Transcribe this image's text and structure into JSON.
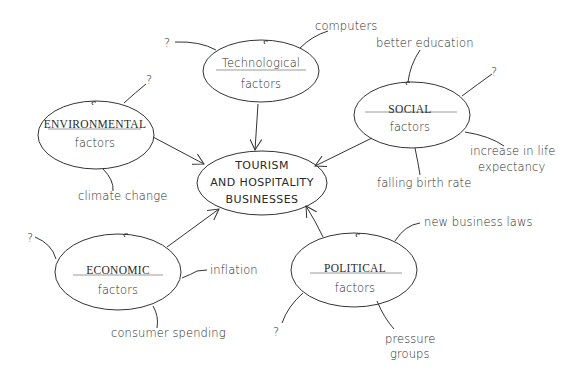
{
  "diagram": {
    "type": "mind-map",
    "center": {
      "lines": [
        "TOURISM",
        "AND HOSPITALITY",
        "BUSINESSES"
      ]
    },
    "nodes": {
      "technological": {
        "title": "Technological",
        "subtitle": "factors",
        "branches": [
          "computers",
          "?"
        ]
      },
      "social": {
        "title": "SOCIAL",
        "subtitle": "factors",
        "branches": [
          "better education",
          "?",
          "increase in life",
          "expectancy",
          "falling birth rate"
        ]
      },
      "environmental": {
        "title": "ENVIRONMENTAL",
        "subtitle": "factors",
        "branches": [
          "?",
          "climate change"
        ]
      },
      "economic": {
        "title": "ECONOMIC",
        "subtitle": "factors",
        "branches": [
          "?",
          "inflation",
          "consumer spending"
        ]
      },
      "political": {
        "title": "POLITICAL",
        "subtitle": "factors",
        "branches": [
          "new business laws",
          "?",
          "pressure",
          "groups"
        ]
      }
    },
    "colors": {
      "stroke": "#333333",
      "text": "#2a2a2a",
      "underline": "#9a9a9a",
      "background": "#ffffff"
    }
  }
}
